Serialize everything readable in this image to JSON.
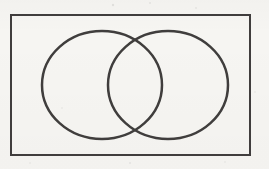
{
  "diagram": {
    "type": "venn-diagram",
    "canvas": {
      "width": 269,
      "height": 169
    },
    "colors": {
      "background": "#f6f5f2",
      "line": "#3f3e3c"
    },
    "universal_set_rectangle": {
      "x": 11,
      "y": 15,
      "width": 239,
      "height": 140,
      "stroke_width": 2
    },
    "circles": [
      {
        "name": "left-circle",
        "cx": 102,
        "cy": 85,
        "rx": 60,
        "ry": 54,
        "stroke_width": 2.5
      },
      {
        "name": "right-circle",
        "cx": 168,
        "cy": 85,
        "rx": 60,
        "ry": 54,
        "stroke_width": 2.5
      }
    ],
    "scan_noise_specks": [
      {
        "x": 113,
        "y": 5,
        "r": 1.2,
        "opacity": 0.1
      },
      {
        "x": 150,
        "y": 3,
        "r": 1.0,
        "opacity": 0.08
      },
      {
        "x": 196,
        "y": 8,
        "r": 1.1,
        "opacity": 0.07
      },
      {
        "x": 62,
        "y": 108,
        "r": 1.0,
        "opacity": 0.06
      },
      {
        "x": 255,
        "y": 92,
        "r": 1.0,
        "opacity": 0.06
      },
      {
        "x": 130,
        "y": 163,
        "r": 1.1,
        "opacity": 0.08
      },
      {
        "x": 30,
        "y": 163,
        "r": 1.0,
        "opacity": 0.06
      },
      {
        "x": 225,
        "y": 162,
        "r": 1.0,
        "opacity": 0.06
      }
    ]
  }
}
